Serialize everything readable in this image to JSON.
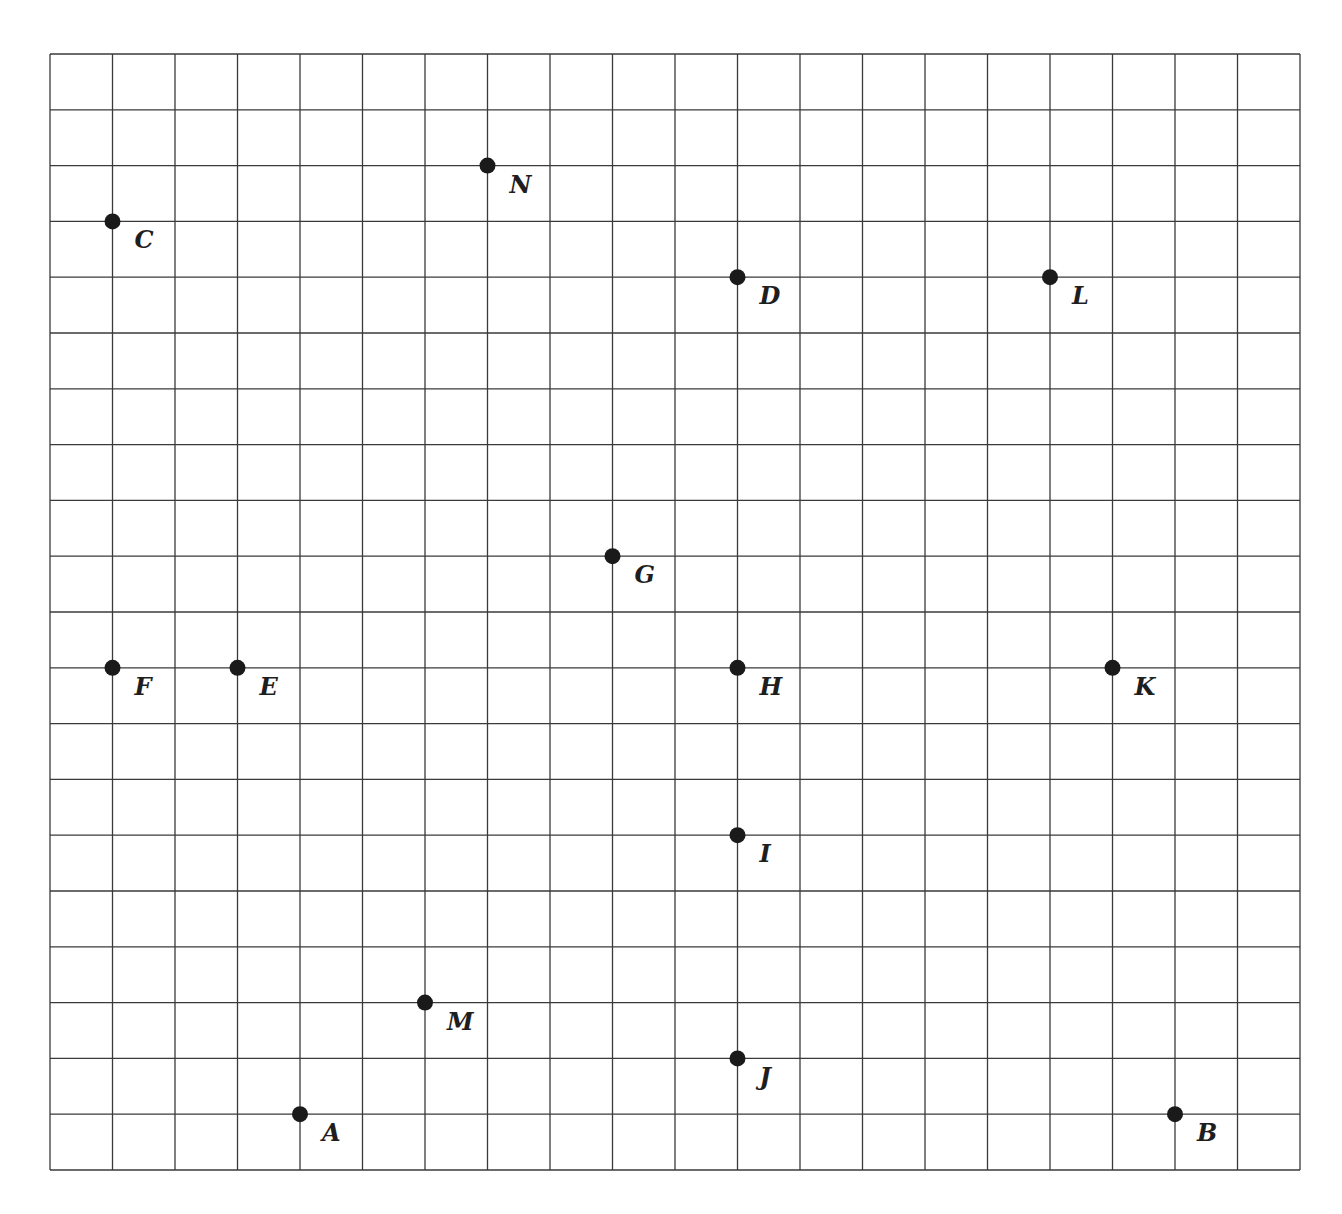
{
  "grid": {
    "columns": 20,
    "rows": 20,
    "left_px": 50,
    "top_px": 54,
    "right_px": 1300,
    "bottom_px": 1170,
    "line_color": "#3a3a3a",
    "background": "#ffffff"
  },
  "point_style": {
    "dot_color": "#1a1a1a",
    "dot_radius": 8,
    "label_offset_x": 22,
    "label_offset_y": 27
  },
  "points": [
    {
      "label": "C",
      "x": 1,
      "y": 17
    },
    {
      "label": "N",
      "x": 7,
      "y": 18
    },
    {
      "label": "D",
      "x": 11,
      "y": 16
    },
    {
      "label": "L",
      "x": 16,
      "y": 16
    },
    {
      "label": "G",
      "x": 9,
      "y": 11
    },
    {
      "label": "F",
      "x": 1,
      "y": 9
    },
    {
      "label": "E",
      "x": 3,
      "y": 9
    },
    {
      "label": "H",
      "x": 11,
      "y": 9
    },
    {
      "label": "K",
      "x": 17,
      "y": 9
    },
    {
      "label": "I",
      "x": 11,
      "y": 6
    },
    {
      "label": "M",
      "x": 6,
      "y": 3
    },
    {
      "label": "J",
      "x": 11,
      "y": 2
    },
    {
      "label": "A",
      "x": 4,
      "y": 1
    },
    {
      "label": "B",
      "x": 18,
      "y": 1
    }
  ]
}
